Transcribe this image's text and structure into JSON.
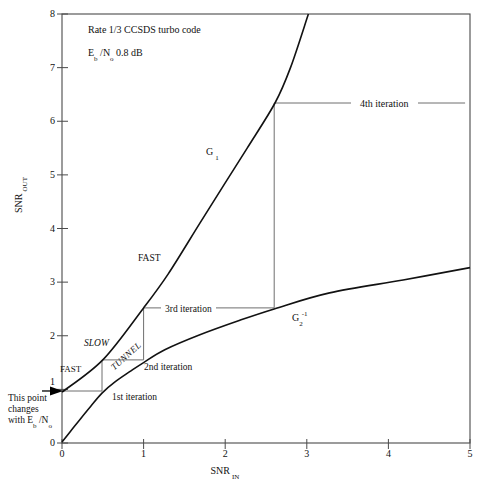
{
  "figure": {
    "title_line1": "Rate 1/3 CCSDS turbo code",
    "ebno": {
      "e": "E",
      "e_sub": "b",
      "n": " /N",
      "n_sub": "o",
      "value": " 0.8 dB"
    }
  },
  "axes": {
    "x": {
      "label_main": "SNR",
      "label_sub": "IN"
    },
    "y": {
      "label_main": "SNR",
      "label_sub": "OUT"
    }
  },
  "curve_labels": {
    "g1_main": "G",
    "g1_sub": "1",
    "g2_main": "G",
    "g2_sub": "2",
    "g2_sup": "-1"
  },
  "region_labels": {
    "fast_upper": "FAST",
    "slow": "SLOW",
    "tunnel": "TUNNEL",
    "fast_lower": "FAST"
  },
  "iteration_labels": {
    "first": "1st iteration",
    "second": "2nd iteration",
    "third": "3rd iteration",
    "fourth": "4th iteration"
  },
  "note": {
    "line1": "This point",
    "line2": "changes",
    "line3_pre": "with E",
    "line3_sub1": "b",
    "line3_mid": " /N",
    "line3_sub2": "o"
  },
  "chart_data": {
    "type": "line",
    "title": "Rate 1/3 CCSDS turbo code",
    "annotation": "Eb/No 0.8 dB",
    "xlabel": "SNR_IN",
    "ylabel": "SNR_OUT",
    "xlim": [
      0,
      5
    ],
    "ylim": [
      0,
      8
    ],
    "x_ticks": [
      0,
      1,
      2,
      3,
      4,
      5
    ],
    "y_ticks": [
      0,
      1,
      2,
      3,
      4,
      5,
      6,
      7,
      8
    ],
    "grid": false,
    "series": [
      {
        "name": "G1",
        "points": [
          [
            0,
            0.95
          ],
          [
            0.5,
            1.55
          ],
          [
            1.0,
            2.52
          ],
          [
            1.3,
            3.15
          ],
          [
            1.69,
            4.1
          ],
          [
            2.0,
            4.85
          ],
          [
            2.27,
            5.5
          ],
          [
            2.61,
            6.34
          ],
          [
            2.8,
            7.0
          ],
          [
            3.02,
            8.0
          ]
        ]
      },
      {
        "name": "G2_inverse",
        "points": [
          [
            0,
            0.02
          ],
          [
            0.1,
            0.21
          ],
          [
            0.22,
            0.44
          ],
          [
            0.35,
            0.68
          ],
          [
            0.49,
            0.93
          ],
          [
            0.65,
            1.14
          ],
          [
            0.83,
            1.33
          ],
          [
            1.0,
            1.5
          ],
          [
            1.26,
            1.74
          ],
          [
            1.69,
            2.02
          ],
          [
            2.18,
            2.29
          ],
          [
            2.6,
            2.5
          ],
          [
            3.28,
            2.8
          ],
          [
            4.18,
            3.04
          ],
          [
            5.0,
            3.27
          ]
        ]
      }
    ],
    "trajectory": {
      "name": "decoder_iterations",
      "start_marker": "arrow-on-y-axis",
      "points": [
        [
          0,
          0.97
        ],
        [
          0.49,
          0.97
        ],
        [
          0.49,
          1.55
        ],
        [
          1.0,
          1.55
        ],
        [
          1.0,
          2.52
        ],
        [
          2.6,
          2.52
        ],
        [
          2.6,
          6.34
        ],
        [
          4.94,
          6.34
        ]
      ]
    }
  }
}
